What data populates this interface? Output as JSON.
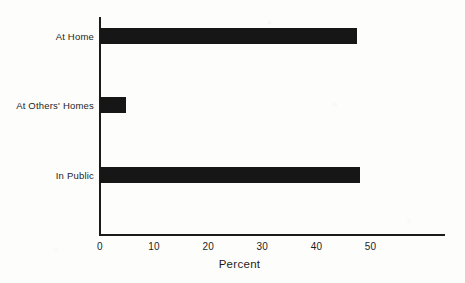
{
  "chart_data": {
    "type": "bar",
    "orientation": "horizontal",
    "title": "",
    "xlabel": "Percent",
    "ylabel": "",
    "categories": [
      "At Home",
      "At Others' Homes",
      "In Public"
    ],
    "values": [
      47.5,
      4.8,
      48
    ],
    "xlim": [
      0,
      57
    ],
    "xticks": [
      0,
      10,
      20,
      30,
      40,
      50
    ],
    "xtick_labels": [
      "0",
      "10",
      "20",
      "30",
      "40",
      "50"
    ],
    "grid": false,
    "legend": null,
    "bar_color": "#161616",
    "axis_color": "#1b1b1b",
    "background_color": "#fdfdfb"
  }
}
